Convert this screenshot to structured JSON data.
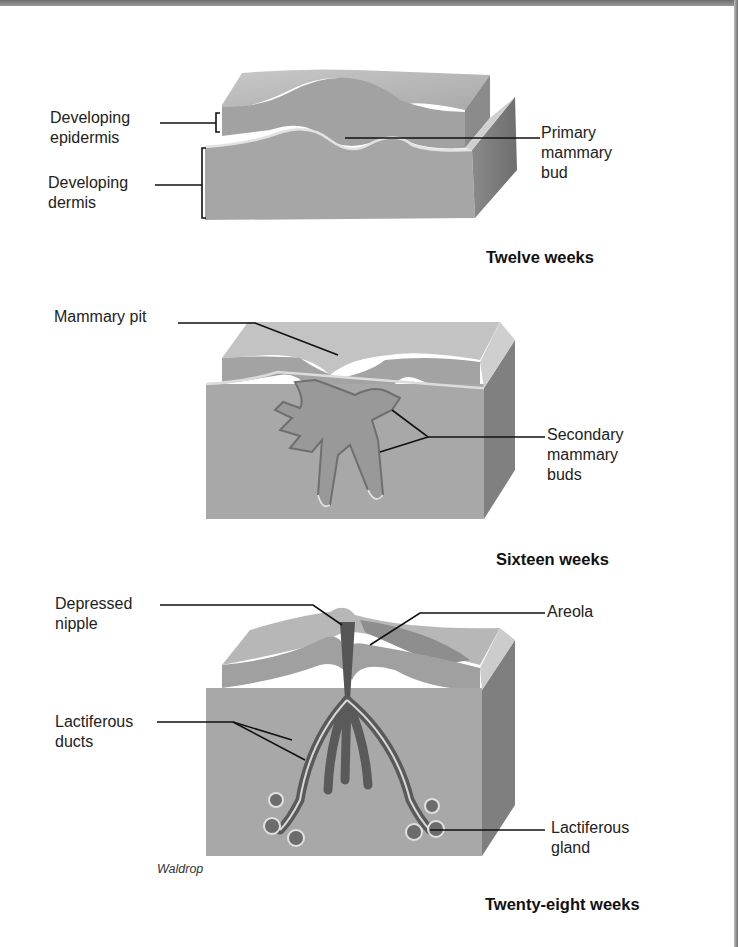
{
  "figure": {
    "panels": [
      {
        "id": "twelve-weeks",
        "stage_label": "Twelve weeks",
        "labels": {
          "epidermis": "Developing\nepidermis",
          "dermis": "Developing\ndermis",
          "primary_bud": "Primary\nmammary\nbud"
        }
      },
      {
        "id": "sixteen-weeks",
        "stage_label": "Sixteen weeks",
        "labels": {
          "pit": "Mammary pit",
          "secondary_buds": "Secondary\nmammary\nbuds"
        }
      },
      {
        "id": "twenty-eight-weeks",
        "stage_label": "Twenty-eight weeks",
        "labels": {
          "nipple": "Depressed\nnipple",
          "areola": "Areola",
          "ducts": "Lactiferous\nducts",
          "gland": "Lactiferous\ngland"
        }
      }
    ],
    "credit": "Waldrop"
  },
  "colors": {
    "tissue_top": "#b9b9b9",
    "tissue_front": "#a4a4a4",
    "tissue_side": "#7e7e7e",
    "duct": "#6a6a6a",
    "leader": "#111111"
  }
}
